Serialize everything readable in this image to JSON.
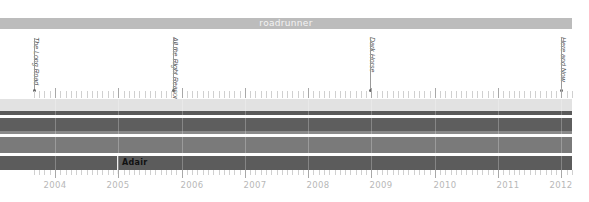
{
  "chart_data": {
    "type": "timeline",
    "title": "roadrunner",
    "xlabel": "",
    "ylabel": "",
    "x_range": [
      2003.2,
      2012.1
    ],
    "tick_labels": [
      "2004",
      "2005",
      "2006",
      "2007",
      "2008",
      "2009",
      "2010",
      "2011",
      "2012"
    ],
    "events": [
      {
        "label": "The Long Road",
        "year": 2003.7
      },
      {
        "label": "All the Right Reasons",
        "year": 2005.8
      },
      {
        "label": "Dark Horse",
        "year": 2008.9
      },
      {
        "label": "Here and Now",
        "year": 2011.9
      }
    ],
    "bands": [
      {
        "name": "band-1",
        "color": "#e2e2e2",
        "start": 2003.2,
        "end": 2012.1
      },
      {
        "name": "band-2",
        "color": "#5a5a5a",
        "start": 2003.2,
        "end": 2012.1
      },
      {
        "name": "band-3",
        "color": "#5e5e5e",
        "start": 2003.2,
        "end": 2012.1
      },
      {
        "name": "band-4",
        "color": "#7a7a7a",
        "start": 2003.2,
        "end": 2012.1
      },
      {
        "name": "band-5",
        "color": "#5c5c5c",
        "start": 2003.2,
        "end": 2012.1,
        "annotation": {
          "label": "Adair",
          "year": 2005
        }
      }
    ],
    "grid": true,
    "legend": "none"
  },
  "header": {
    "title": "roadrunner"
  },
  "albums": [
    {
      "label": "The Long Road",
      "x": 34
    },
    {
      "label": "All the Right Reasons",
      "x": 173
    },
    {
      "label": "Dark Horse",
      "x": 370
    },
    {
      "label": "Here and Now",
      "x": 561
    }
  ],
  "years": [
    {
      "label": "2004",
      "x": 55
    },
    {
      "label": "2005",
      "x": 118
    },
    {
      "label": "2006",
      "x": 192
    },
    {
      "label": "2007",
      "x": 255
    },
    {
      "label": "2008",
      "x": 318
    },
    {
      "label": "2009",
      "x": 381
    },
    {
      "label": "2010",
      "x": 445
    },
    {
      "label": "2011",
      "x": 508
    },
    {
      "label": "2012",
      "x": 561
    }
  ],
  "annotation": {
    "label": "Adair"
  },
  "colors": {
    "title_bar": "#bcbcbc",
    "band_light": "#e2e2e2",
    "band_dark": "#5a5a5a",
    "band_mid": "#7a7a7a"
  }
}
